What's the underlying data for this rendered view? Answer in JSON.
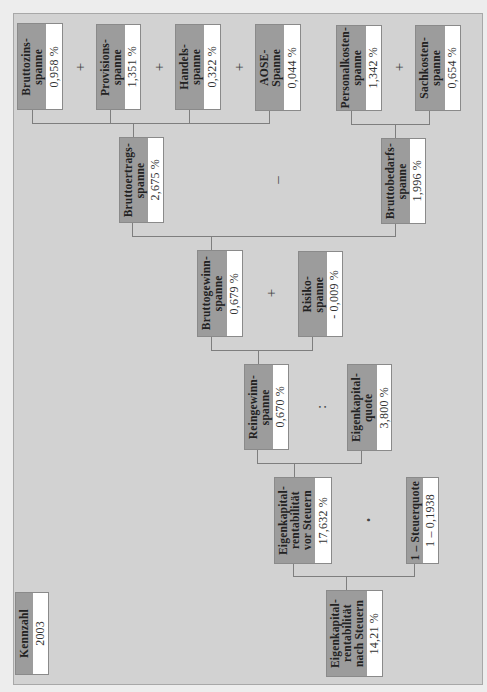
{
  "diagram": {
    "legend": {
      "label": "Kennzahl",
      "value": "2003"
    },
    "nodes": {
      "bruttozins": {
        "label": "Bruttozins-\nspanne",
        "value": "0,958 %"
      },
      "provisions": {
        "label": "Provisions-\nspanne",
        "value": "1,351 %"
      },
      "handels": {
        "label": "Handels-\nspanne",
        "value": "0,322 %"
      },
      "aose": {
        "label": "AOSE-\nSpanne",
        "value": "0,044 %"
      },
      "personalkosten": {
        "label": "Personalkosten-\nspanne",
        "value": "1,342 %"
      },
      "sachkosten": {
        "label": "Sachkosten-\nspanne",
        "value": "0,654 %"
      },
      "bruttoertrag": {
        "label": "Bruttoertrags-\nspanne",
        "value": "2,675 %"
      },
      "bruttobedarf": {
        "label": "Bruttobedarfs-\nspanne",
        "value": "1,996 %"
      },
      "bruttogewinn": {
        "label": "Bruttogewinn-\nspanne",
        "value": "0,679 %"
      },
      "risiko": {
        "label": "Risiko-\nspanne",
        "value": "- 0,009 %"
      },
      "reingewinn": {
        "label": "Reingewinn-\nspanne",
        "value": "0,670 %"
      },
      "ekquote": {
        "label": "Eigenkapital-\nquote",
        "value": "3,800 %"
      },
      "ek_vor": {
        "label": "Eigenkapital-\nrentabilität\nvor Steuern",
        "value": "17,632 %"
      },
      "steuerquote": {
        "label": "1 – Steuerquote",
        "value": "1 – 0,1938"
      },
      "ek_nach": {
        "label": "Eigenkapital-\nrentabilität\nnach Steuern",
        "value": "14,21 %"
      }
    },
    "operators": {
      "plus1": "+",
      "plus2": "+",
      "plus3": "+",
      "plus4": "+",
      "minus": "–",
      "plus5": "+",
      "divide": ":",
      "multiply": "•"
    },
    "colors": {
      "background": "#d2d2d2",
      "label_fill": "#9c9c9c",
      "value_fill": "#ffffff",
      "connector": "#7e7e7e"
    }
  }
}
